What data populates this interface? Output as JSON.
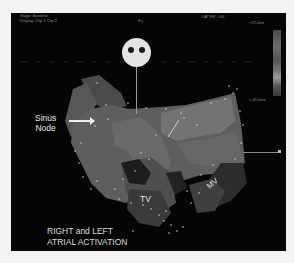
{
  "figure": {
    "header": {
      "stage": "Stage: Baseline",
      "display": "Display: Clip 1 Clip 2",
      "orientation_marker": "Fa",
      "map_type": "LAT  FR : 0/0"
    },
    "color_scale": {
      "max_label": "≈72.0ms",
      "min_label": "≈-45.0ms"
    },
    "orientation_icon": "head-orientation-icon",
    "annotations": {
      "sinus_node_line1": "Sinus",
      "sinus_node_line2": "Node",
      "tricuspid_valve": "TV",
      "mitral_valve": "MV"
    },
    "caption": {
      "line1": "RIGHT and LEFT",
      "line2": "ATRIAL ACTIVATION"
    },
    "colors": {
      "background": "#050505",
      "page": "#f2f2f2",
      "label": "#e6e6e6"
    }
  }
}
